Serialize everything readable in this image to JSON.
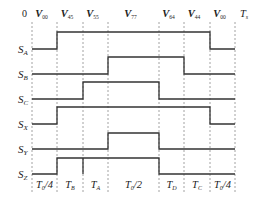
{
  "diagram": {
    "type": "switching-timing-diagram",
    "top_labels": {
      "start": "0",
      "end": "T",
      "end_sub": "s",
      "vectors": [
        {
          "main": "V",
          "sub": "00"
        },
        {
          "main": "V",
          "sub": "45"
        },
        {
          "main": "V",
          "sub": "55"
        },
        {
          "main": "V",
          "sub": "77"
        },
        {
          "main": "V",
          "sub": "64"
        },
        {
          "main": "V",
          "sub": "44"
        },
        {
          "main": "V",
          "sub": "00"
        }
      ]
    },
    "signals": [
      {
        "main": "S",
        "sub": "A",
        "high_from": 1,
        "high_to": 6
      },
      {
        "main": "S",
        "sub": "B",
        "high_from": 3,
        "high_to": 5
      },
      {
        "main": "S",
        "sub": "C",
        "high_from": 2,
        "high_to": 4
      },
      {
        "main": "S",
        "sub": "X",
        "high_from": 1,
        "high_to": 6
      },
      {
        "main": "S",
        "sub": "Y",
        "high_from": 3,
        "high_to": 4
      },
      {
        "main": "S",
        "sub": "Z",
        "high_from": 1,
        "high_to": 4
      }
    ],
    "bottom_labels": [
      {
        "main": "T",
        "sub": "0",
        "suffix": "/4"
      },
      {
        "main": "T",
        "sub": "B",
        "suffix": ""
      },
      {
        "main": "T",
        "sub": "A",
        "suffix": ""
      },
      {
        "main": "T",
        "sub": "0",
        "suffix": "/2"
      },
      {
        "main": "T",
        "sub": "D",
        "suffix": ""
      },
      {
        "main": "T",
        "sub": "C",
        "suffix": ""
      },
      {
        "main": "T",
        "sub": "0",
        "suffix": "/4"
      }
    ],
    "colors": {
      "trace": "#333333",
      "grid": "#8a8a8a",
      "text": "#222222"
    }
  }
}
